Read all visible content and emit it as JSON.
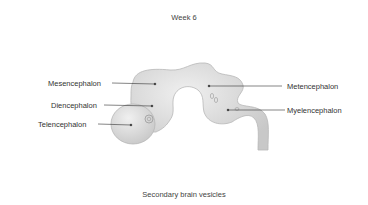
{
  "figure": {
    "title": "Week 6",
    "caption": "Secondary brain vesicles",
    "colors": {
      "vesicle_fill": "#dcdcdc",
      "vesicle_stroke": "#b8b8b8",
      "leader_line": "#333333",
      "text": "#333333"
    },
    "labels": [
      {
        "id": "mesencephalon",
        "text": "Mesencephalon",
        "side": "left"
      },
      {
        "id": "diencephalon",
        "text": "Diencephalon",
        "side": "left"
      },
      {
        "id": "telencephalon",
        "text": "Telencephalon",
        "side": "left"
      },
      {
        "id": "metencephalon",
        "text": "Metencephalon",
        "side": "right"
      },
      {
        "id": "myelencephalon",
        "text": "Myelencephalon",
        "side": "right"
      }
    ]
  }
}
